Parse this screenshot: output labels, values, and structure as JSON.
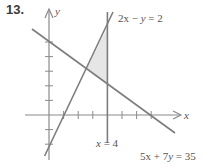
{
  "problem_number": "13.",
  "axes": {
    "x_label": "x",
    "y_label": "y"
  },
  "lines": [
    {
      "id": "line1",
      "equation": "2x − y = 2",
      "label_parts": [
        "2x",
        " − ",
        "y",
        " = 2"
      ]
    },
    {
      "id": "line2",
      "equation": "5x + 7y = 35",
      "label_parts": [
        "5x",
        " + 7",
        "y",
        " = 35"
      ]
    },
    {
      "id": "line3",
      "equation": "x = 4",
      "label_parts": [
        "x",
        " = 4"
      ]
    }
  ],
  "shaded_region": {
    "vertices": [
      [
        2.58,
        3.16
      ],
      [
        4,
        2.14
      ],
      [
        4,
        6
      ]
    ],
    "color": "#e6e6e6"
  },
  "colors": {
    "line": "#7d7d7d",
    "axis": "#8a8a8a",
    "text": "#555555"
  }
}
